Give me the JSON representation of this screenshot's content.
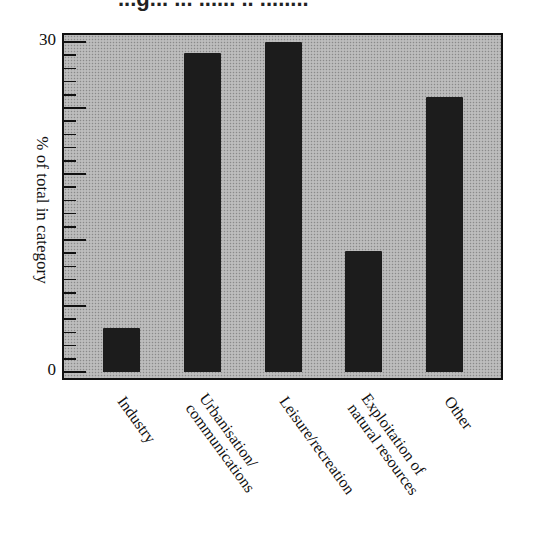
{
  "header": {
    "title_partial": "...g... ... ...... .. ........"
  },
  "chart_data": {
    "type": "bar",
    "title": "",
    "categories": [
      "Industry",
      "Urbanisation/ communications",
      "Leisure/recreation",
      "Exploitation of natural resources",
      "Other"
    ],
    "values": [
      4,
      29,
      30,
      11,
      25
    ],
    "xlabel": "",
    "ylabel": "% of total in category",
    "ylim": [
      0,
      30
    ],
    "ytick_labels": [
      "0",
      "30"
    ],
    "grid": false,
    "legend": null,
    "colors": {
      "bar": "#1c1c1c",
      "plot_background": "#b4b4b4",
      "frame": "#111111"
    }
  },
  "axis": {
    "y_label": "% of total in category",
    "y_top_label": "30",
    "y_bottom_label": "0"
  },
  "labels": {
    "x0_line1": "Industry",
    "x1_line1": "Urbanisation/",
    "x1_line2": "communications",
    "x2_line1": "Leisure/recreation",
    "x3_line1": "Exploitation of",
    "x3_line2": "natural resources",
    "x4_line1": "Other"
  }
}
